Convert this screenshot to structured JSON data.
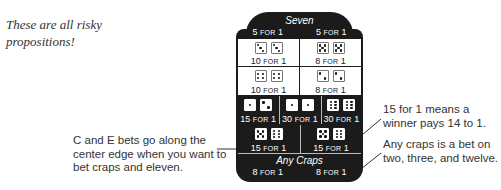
{
  "notes": {
    "top_left": "These are all risky propositions!",
    "left_callout": "C and E bets go along the center edge when you want to bet craps and eleven.",
    "right_callout_1": "15 for 1 means a winner pays 14 to 1.",
    "right_callout_2": "Any craps is a bet on two, three, and twelve."
  },
  "board": {
    "seven": {
      "label": "Seven",
      "odds": [
        {
          "num": "5",
          "for": "FOR",
          "one": "1"
        },
        {
          "num": "5",
          "for": "FOR",
          "one": "1"
        }
      ]
    },
    "rows": [
      {
        "cells": [
          {
            "dice": [
              3,
              3
            ],
            "num": "10",
            "for": "FOR",
            "one": "1"
          },
          {
            "dice": [
              5,
              5
            ],
            "num": "8",
            "for": "FOR",
            "one": "1"
          }
        ]
      },
      {
        "cells": [
          {
            "dice": [
              4,
              4
            ],
            "num": "10",
            "for": "FOR",
            "one": "1"
          },
          {
            "dice": [
              2,
              2
            ],
            "num": "8",
            "for": "FOR",
            "one": "1"
          }
        ]
      },
      {
        "cells": [
          {
            "dice": [
              1,
              2
            ],
            "num": "15",
            "for": "FOR",
            "one": "1"
          },
          {
            "dice": [
              1,
              1
            ],
            "num": "30",
            "for": "FOR",
            "one": "1"
          },
          {
            "dice": [
              6,
              6
            ],
            "num": "30",
            "for": "FOR",
            "one": "1"
          }
        ]
      },
      {
        "cells": [
          {
            "dice": [
              5,
              6
            ],
            "num": "15",
            "for": "FOR",
            "one": "1"
          },
          {
            "dice": [
              5,
              6
            ],
            "num": "15",
            "for": "FOR",
            "one": "1"
          }
        ]
      }
    ],
    "any_craps": {
      "label": "Any Craps",
      "odds": [
        {
          "num": "8",
          "for": "FOR",
          "one": "1"
        },
        {
          "num": "8",
          "for": "FOR",
          "one": "1"
        }
      ]
    }
  },
  "colors": {
    "board": "#1b1b1b",
    "cell": "#ffffff",
    "text": "#333333"
  }
}
